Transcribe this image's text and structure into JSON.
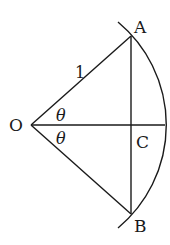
{
  "diagram": {
    "type": "geometry-sector",
    "points": {
      "O": {
        "label": "O",
        "x": 31,
        "y": 125
      },
      "A": {
        "label": "A",
        "x": 131,
        "y": 36
      },
      "B": {
        "label": "B",
        "x": 131,
        "y": 214
      },
      "C": {
        "label": "C",
        "x": 131,
        "y": 125
      }
    },
    "labels": {
      "radius": "1",
      "angle_top": "θ",
      "angle_bottom": "θ",
      "O": "O",
      "A": "A",
      "B": "B",
      "C": "C"
    },
    "stroke_color": "#1a1a1a"
  }
}
